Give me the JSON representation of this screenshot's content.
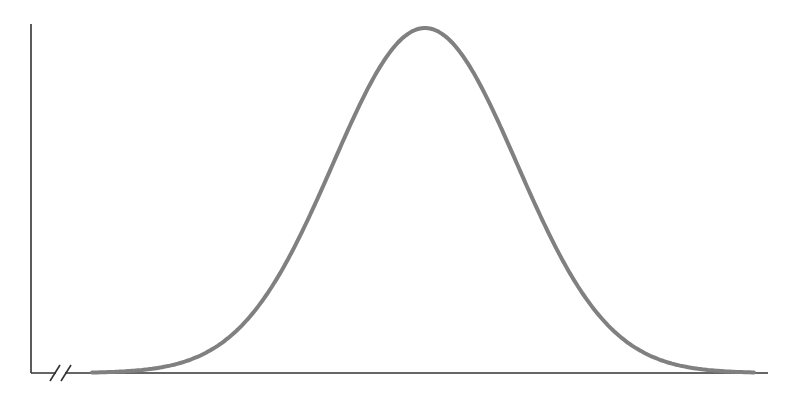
{
  "chart_data": {
    "type": "line",
    "title": "",
    "subtitle": "",
    "xlabel": "",
    "ylabel": "",
    "axis_break": true,
    "grid": false,
    "legend": null,
    "colors": {
      "axis": "#333333",
      "curve": "#808080",
      "background": "#ffffff"
    },
    "geometry": {
      "y_axis": {
        "x": 31,
        "y_top": 24,
        "y_bottom": 373
      },
      "x_axis": {
        "y": 373,
        "x_start": 31,
        "x_end": 768
      },
      "break_marks": [
        {
          "x": 55
        },
        {
          "x": 66
        }
      ],
      "curve": {
        "x_start": 92,
        "x_end": 755,
        "peak_x": 425,
        "peak_y": 28,
        "baseline_y": 373,
        "sigma_px": 92
      }
    },
    "series": [
      {
        "name": "normal distribution",
        "mean": 0,
        "std": 1,
        "x_range": [
          -3.6,
          3.6
        ]
      }
    ]
  }
}
